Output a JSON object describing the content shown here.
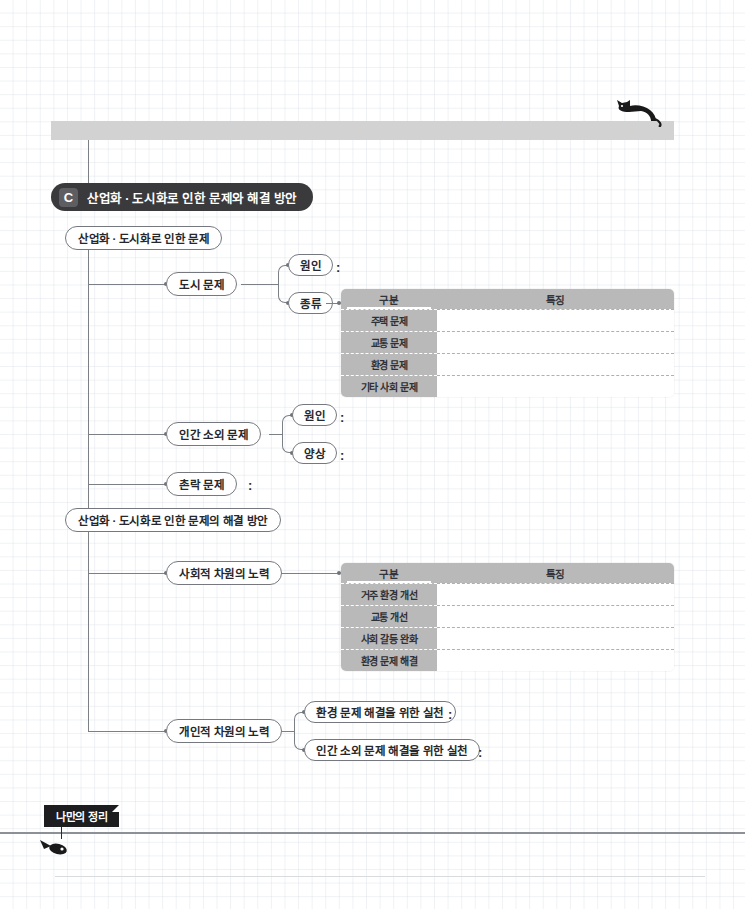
{
  "page": {
    "accent_dark": "#3a3a3c",
    "table_header_gray": "#b9b9b9",
    "shelf_gray": "#d2d2d2",
    "line_gray": "#7b7f86"
  },
  "decorations": {
    "cat_icon": "cat-icon",
    "fish_icon": "fish-bone-icon",
    "shelf": "gray-shelf-bar"
  },
  "banner": {
    "badge": "C",
    "title": "산업화 · 도시화로 인한 문제와 해결 방안"
  },
  "branch1": {
    "root": "산업화 · 도시화로 인한 문제",
    "child1": {
      "label": "도시 문제",
      "sub1": "원인",
      "sub1_colon": ":",
      "sub2": "종류"
    },
    "child2": {
      "label": "인간 소외 문제",
      "sub1": "원인",
      "sub1_colon": ":",
      "sub2": "양상",
      "sub2_colon": ":"
    },
    "child3": {
      "label": "촌락 문제",
      "colon": ":"
    }
  },
  "branch2": {
    "root": "산업화 · 도시화로 인한 문제의 해결 방안",
    "child1": {
      "label": "사회적 차원의 노력"
    },
    "child2": {
      "label": "개인적 차원의 노력",
      "sub1": "환경 문제 해결을 위한 실천",
      "sub1_colon": ":",
      "sub2": "인간 소외 문제 해결을 위한 실천",
      "sub2_colon": ":"
    }
  },
  "table1": {
    "headers": [
      "구분",
      "특징"
    ],
    "rows": [
      "주택 문제",
      "교통 문제",
      "환경 문제",
      "기타 사회 문제"
    ],
    "values": [
      "",
      "",
      "",
      ""
    ]
  },
  "table2": {
    "headers": [
      "구분",
      "특징"
    ],
    "rows": [
      "거주 환경 개선",
      "교통 개선",
      "사회 갈등 완화",
      "환경 문제 해결"
    ],
    "values": [
      "",
      "",
      "",
      ""
    ]
  },
  "footer": {
    "label": "나만의 정리"
  }
}
